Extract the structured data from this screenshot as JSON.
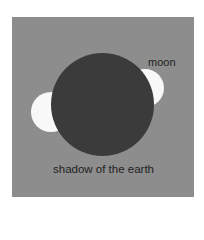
{
  "diagram": {
    "labels": {
      "moon": "moon",
      "shadow": "shadow of the earth"
    },
    "colors": {
      "background": "#8d8d8d",
      "shadow": "#3b3b3b",
      "moon": "#f8f8f8"
    }
  }
}
